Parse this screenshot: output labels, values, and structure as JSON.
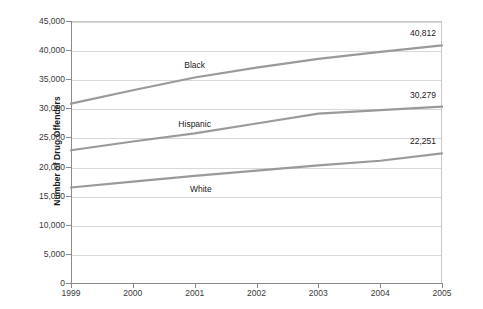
{
  "chart_data": {
    "type": "line",
    "title": "",
    "xlabel": "",
    "ylabel": "Number of Drug Offenders",
    "x": [
      1999,
      2000,
      2001,
      2002,
      2003,
      2004,
      2005
    ],
    "xtick_labels": [
      "1999",
      "2000",
      "2001",
      "2002",
      "2003",
      "2004",
      "2005"
    ],
    "ylim": [
      0,
      45000
    ],
    "ytick_values": [
      0,
      5000,
      10000,
      15000,
      20000,
      25000,
      30000,
      35000,
      40000,
      45000
    ],
    "ytick_labels": [
      "0",
      "5,000",
      "10,000",
      "15,000",
      "20,000",
      "25,000",
      "30,000",
      "35,000",
      "40,000",
      "45,000"
    ],
    "grid": true,
    "legend": "inline-series-labels",
    "line_color": "#9a9a9a",
    "series": [
      {
        "name": "Black",
        "values": [
          30800,
          33100,
          35300,
          37000,
          38500,
          39700,
          40812
        ],
        "end_label": "40,812",
        "label_x": 2001,
        "label_y": 37400
      },
      {
        "name": "Hispanic",
        "values": [
          22800,
          24300,
          25700,
          27400,
          29100,
          29700,
          30279
        ],
        "end_label": "30,279",
        "label_x": 2001,
        "label_y": 27300
      },
      {
        "name": "White",
        "values": [
          16400,
          17400,
          18400,
          19300,
          20200,
          21000,
          22251
        ],
        "end_label": "22,251",
        "label_x": 2001.1,
        "label_y": 16200
      }
    ]
  }
}
